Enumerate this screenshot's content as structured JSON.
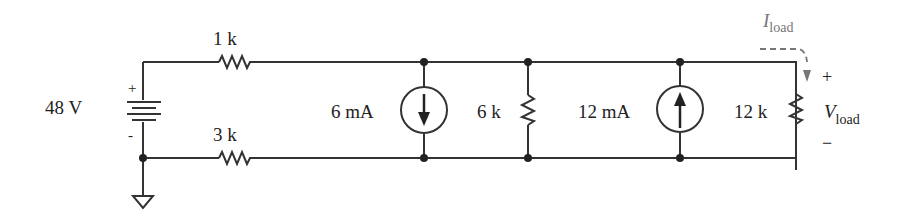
{
  "circuit": {
    "source": {
      "label": "48 V",
      "plus": "+",
      "minus": "-"
    },
    "r_top": {
      "label": "1 k"
    },
    "r_bottom": {
      "label": "3 k"
    },
    "isrc_down": {
      "label": "6 mA"
    },
    "r_mid": {
      "label": "6 k"
    },
    "isrc_up": {
      "label": "12 mA"
    },
    "r_load": {
      "label": "12 k"
    },
    "i_load": {
      "main": "I",
      "sub": "load"
    },
    "v_load": {
      "main": "V",
      "sub": "load",
      "plus": "+",
      "minus": "−"
    }
  },
  "colors": {
    "wire": "#333333",
    "current_arrow": "#777777",
    "annotation": "#666666"
  }
}
